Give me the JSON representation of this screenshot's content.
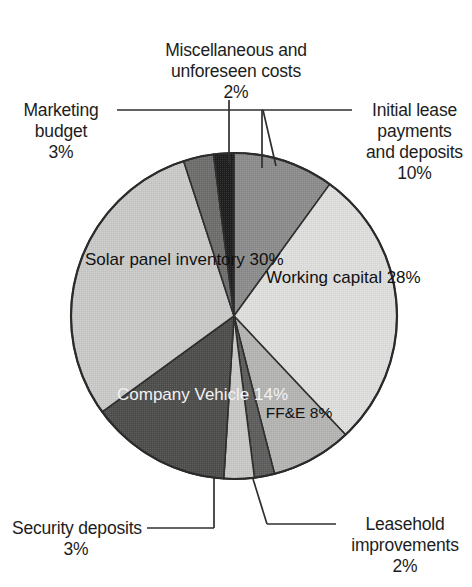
{
  "chart_data": {
    "type": "pie",
    "title": "",
    "subtitle": "",
    "xlabel": "",
    "ylabel": "",
    "legend_position": "none",
    "grid": false,
    "units": "percent",
    "total": 100,
    "start_angle_deg": 0,
    "direction": "clockwise",
    "categories": [
      "Initial lease payments and deposits",
      "Working capital",
      "FF&E",
      "Leasehold improvements",
      "Security deposits",
      "Company Vehicle",
      "Solar panel inventory",
      "Marketing budget",
      "Miscellaneous and unforeseen costs"
    ],
    "values": [
      10,
      28,
      8,
      2,
      3,
      14,
      30,
      3,
      2
    ],
    "slices": [
      {
        "label": "Initial lease payments and deposits",
        "label_lines": [
          "Initial lease",
          "payments",
          "and deposits"
        ],
        "value": 10,
        "value_text": "10%",
        "color": "#8c8c8c",
        "label_placement": "outside-right",
        "leader": true
      },
      {
        "label": "Working capital",
        "label_lines": [
          "Working",
          "capital"
        ],
        "value": 28,
        "value_text": "28%",
        "color": "#dededd",
        "label_placement": "inside",
        "leader": false
      },
      {
        "label": "FF&E",
        "label_lines": [
          "FF&E"
        ],
        "value": 8,
        "value_text": "8%",
        "color": "#b4b4b3",
        "label_placement": "inside",
        "leader": false
      },
      {
        "label": "Leasehold improvements",
        "label_lines": [
          "Leasehold",
          "improvements"
        ],
        "value": 2,
        "value_text": "2%",
        "color": "#5e5e5d",
        "label_placement": "outside-bottom-right",
        "leader": true
      },
      {
        "label": "Security deposits",
        "label_lines": [
          "Security deposits"
        ],
        "value": 3,
        "value_text": "3%",
        "color": "#c8c8c6",
        "label_placement": "outside-bottom-left",
        "leader": true
      },
      {
        "label": "Company Vehicle",
        "label_lines": [
          "Company",
          "Vehicle"
        ],
        "value": 14,
        "value_text": "14%",
        "color": "#4e4e4d",
        "label_placement": "inside",
        "leader": false
      },
      {
        "label": "Solar panel inventory",
        "label_lines": [
          "Solar panel",
          "inventory"
        ],
        "value": 30,
        "value_text": "30%",
        "color": "#c9c9c7",
        "label_placement": "inside",
        "leader": false
      },
      {
        "label": "Marketing budget",
        "label_lines": [
          "Marketing",
          "budget"
        ],
        "value": 3,
        "value_text": "3%",
        "color": "#6e6e6d",
        "label_placement": "outside-top-left",
        "leader": true
      },
      {
        "label": "Miscellaneous and unforeseen costs",
        "label_lines": [
          "Miscellaneous and",
          "unforeseen costs"
        ],
        "value": 2,
        "value_text": "2%",
        "color": "#1f1f1f",
        "label_placement": "outside-top",
        "leader": true
      }
    ],
    "geometry": {
      "center_x": 234,
      "center_y": 316,
      "radius": 163,
      "outline_color": "#2b2b2b"
    }
  },
  "labels": {
    "misc": {
      "l1": "Miscellaneous and",
      "l2": "unforeseen costs",
      "pct": "2%"
    },
    "marketing": {
      "l1": "Marketing",
      "l2": "budget",
      "pct": "3%"
    },
    "initial_lease": {
      "l1": "Initial lease",
      "l2": "payments",
      "l3": "and deposits",
      "pct": "10%"
    },
    "solar": {
      "l1": "Solar panel",
      "l2": "inventory",
      "pct": "30%"
    },
    "working": {
      "l1": "Working",
      "l2": "capital",
      "pct": "28%"
    },
    "vehicle": {
      "l1": "Company",
      "l2": "Vehicle",
      "pct": "14%"
    },
    "ffe": {
      "l1": "FF&E",
      "pct": "8%"
    },
    "security": {
      "l1": "Security deposits",
      "pct": "3%"
    },
    "leasehold": {
      "l1": "Leasehold",
      "l2": "improvements",
      "pct": "2%"
    }
  }
}
